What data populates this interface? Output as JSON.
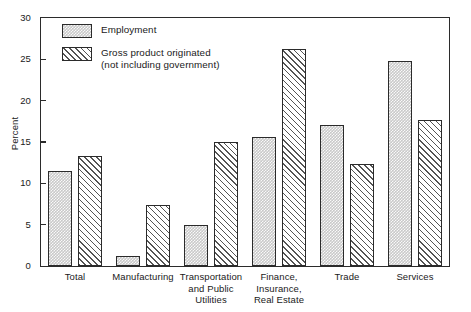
{
  "chart_data": {
    "type": "bar",
    "title": "",
    "xlabel": "",
    "ylabel": "Percent",
    "ylim": [
      0,
      30
    ],
    "yticks": [
      0,
      5,
      10,
      15,
      20,
      25,
      30
    ],
    "grid": false,
    "legend_position": "top-left",
    "categories": [
      "Total",
      "Manufacturing",
      "Transportation\nand Public\nUtilities",
      "Finance,\nInsurance,\nReal Estate",
      "Trade",
      "Services"
    ],
    "series": [
      {
        "name": "Employment",
        "pattern": "stipple",
        "color": "#c9c9c9",
        "values": [
          11.5,
          1.2,
          5.0,
          15.6,
          17.0,
          24.8
        ]
      },
      {
        "name": "Gross product originated\n(not including government)",
        "pattern": "diagonal-hatch",
        "color": "#545454",
        "values": [
          13.3,
          7.4,
          15.0,
          26.3,
          12.3,
          17.7
        ]
      }
    ]
  },
  "legend": {
    "items": [
      {
        "label": "Employment"
      },
      {
        "label": "Gross product originated\n(not including government)"
      }
    ]
  },
  "axis": {
    "y_label": "Percent",
    "y_tick_labels": [
      "0",
      "5",
      "10",
      "15",
      "20",
      "25",
      "30"
    ]
  },
  "colors": {
    "axis": "#2b2b2b",
    "series1": "#c9c9c9",
    "series2": "#545454",
    "background": "#ffffff"
  }
}
